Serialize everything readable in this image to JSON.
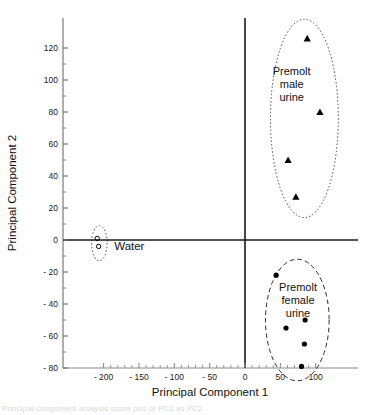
{
  "figure": {
    "caption_partial": "Principal component analysis score plot of PC1 vs PC2"
  },
  "chart_data": {
    "type": "scatter",
    "title": "",
    "xlabel": "Principal Component 1",
    "ylabel": "Principal Component 2",
    "xlim": [
      -215,
      120
    ],
    "ylim": [
      -80,
      135
    ],
    "xticks": [
      -200,
      -150,
      -100,
      -50,
      0,
      50,
      100
    ],
    "xtick_labels": [
      "- 200",
      "- 150",
      "- 100",
      "- 50",
      "0",
      "50",
      "100"
    ],
    "yticks": [
      -80,
      -60,
      -40,
      -20,
      0,
      20,
      40,
      60,
      80,
      100,
      120
    ],
    "ytick_labels": [
      "- 80",
      "- 60",
      "- 40",
      "- 20",
      "0",
      "20",
      "40",
      "60",
      "80",
      "100",
      "120"
    ],
    "minor_tick_step": 10,
    "grid": false,
    "legend": "none",
    "axis_lines_at_origin": true,
    "series": [
      {
        "name": "Premolt male urine",
        "marker": "triangle",
        "color": "#000000",
        "points": [
          {
            "x": 88,
            "y": 126
          },
          {
            "x": 106,
            "y": 80
          },
          {
            "x": 61,
            "y": 50
          },
          {
            "x": 72,
            "y": 27
          }
        ]
      },
      {
        "name": "Premolt female urine",
        "marker": "circle",
        "color": "#000000",
        "points": [
          {
            "x": 44,
            "y": -22
          },
          {
            "x": 85,
            "y": -50
          },
          {
            "x": 58,
            "y": -55
          },
          {
            "x": 84,
            "y": -65
          },
          {
            "x": 80,
            "y": -79
          }
        ]
      },
      {
        "name": "Water",
        "marker": "circle-open",
        "color": "#000000",
        "points": [
          {
            "x": -209,
            "y": 1
          },
          {
            "x": -207,
            "y": -4
          }
        ]
      }
    ],
    "annotations": [
      {
        "label": "Premolt male urine",
        "lines": [
          "Premolt",
          "male",
          "urine"
        ],
        "x": 66,
        "y": 103
      },
      {
        "label": "Premolt female urine",
        "lines": [
          "Premolt",
          "female",
          "urine"
        ],
        "x": 75,
        "y": -32
      },
      {
        "label": "Water",
        "lines": [
          "Water"
        ],
        "x": -185,
        "y": -6
      }
    ],
    "ellipses": [
      {
        "name": "male-cluster-ellipse",
        "cx": 84,
        "cy": 76,
        "rx": 48,
        "ry": 62,
        "style": "dotted"
      },
      {
        "name": "female-cluster-ellipse",
        "cx": 74,
        "cy": -50,
        "rx": 45,
        "ry": 38,
        "style": "dashed"
      },
      {
        "name": "water-cluster-ellipse",
        "cx": -206,
        "cy": -2,
        "rx": 11,
        "ry": 11,
        "style": "dotted"
      }
    ]
  }
}
